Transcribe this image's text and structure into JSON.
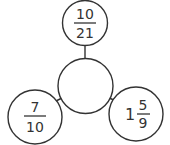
{
  "diagram": {
    "type": "fraction-spider",
    "center": {
      "value": ""
    },
    "nodes": [
      {
        "position": "top",
        "whole": "",
        "numerator": "10",
        "denominator": "21"
      },
      {
        "position": "bottom-left",
        "whole": "",
        "numerator": "7",
        "denominator": "10"
      },
      {
        "position": "bottom-right",
        "whole": "1",
        "numerator": "5",
        "denominator": "9"
      }
    ]
  },
  "colors": {
    "stroke": "#333333",
    "background": "#ffffff"
  }
}
